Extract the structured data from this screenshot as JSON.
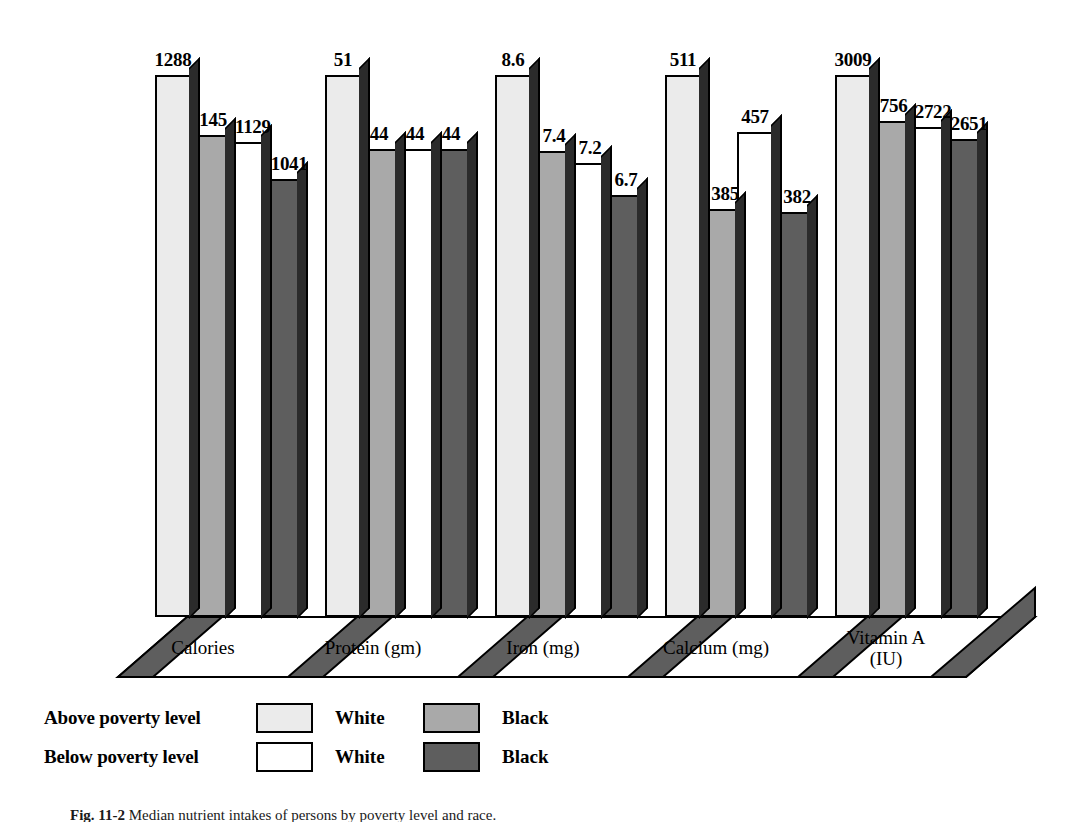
{
  "figure": {
    "caption_prefix": "Fig. 11-2",
    "caption_text": "Median nutrient intakes of persons by poverty level and race."
  },
  "chart_data": {
    "type": "bar",
    "title": "",
    "xlabel": "",
    "ylabel": "",
    "grid": false,
    "legend_position": "bottom-left",
    "categories": [
      "Calories",
      "Protein (gm)",
      "Iron (mg)",
      "Calcium (mg)",
      "Vitamin A (IU)"
    ],
    "category_lines": [
      [
        "Calories"
      ],
      [
        "Protein (gm)"
      ],
      [
        "Iron (mg)"
      ],
      [
        "Calcium (mg)"
      ],
      [
        "Vitamin A",
        "(IU)"
      ]
    ],
    "series": [
      {
        "name": "Above poverty level - White",
        "poverty_level": "Above poverty level",
        "race": "White",
        "color": "#ebebeb",
        "values": [
          1288,
          51,
          8.6,
          511,
          3009
        ],
        "labels": [
          "1288",
          "51",
          "8.6",
          "511",
          "3009"
        ]
      },
      {
        "name": "Above poverty level - Black",
        "poverty_level": "Above poverty level",
        "race": "Black",
        "color": "#a9a9a9",
        "values": [
          1145,
          44,
          7.4,
          385,
          2756
        ],
        "labels": [
          "1145",
          "44",
          "7.4",
          "385",
          "2756"
        ]
      },
      {
        "name": "Below poverty level - White",
        "poverty_level": "Below poverty level",
        "race": "White",
        "color": "#ffffff",
        "values": [
          1129,
          44,
          7.2,
          457,
          2722
        ],
        "labels": [
          "1129",
          "44",
          "7.2",
          "457",
          "2722"
        ]
      },
      {
        "name": "Below poverty level - Black",
        "poverty_level": "Below poverty level",
        "race": "Black",
        "color": "#5e5e5e",
        "values": [
          1041,
          44,
          6.7,
          382,
          2651
        ],
        "labels": [
          "1041",
          "44",
          "6.7",
          "382",
          "2651"
        ]
      }
    ],
    "group_maxima": [
      1288,
      51,
      8.6,
      511,
      3009
    ]
  },
  "legend": {
    "rows": [
      {
        "label": "Above poverty level",
        "items": [
          {
            "swatch_color": "#ebebeb",
            "name": "White"
          },
          {
            "swatch_color": "#a9a9a9",
            "name": "Black"
          }
        ]
      },
      {
        "label": "Below poverty level",
        "items": [
          {
            "swatch_color": "#ffffff",
            "name": "White"
          },
          {
            "swatch_color": "#5e5e5e",
            "name": "Black"
          }
        ]
      }
    ]
  },
  "colors": {
    "above_white": "#ebebeb",
    "above_black": "#a9a9a9",
    "below_white": "#ffffff",
    "below_black": "#5e5e5e",
    "outline": "#000000",
    "floor_edge": "#5e5e5e",
    "background": "#ffffff"
  }
}
